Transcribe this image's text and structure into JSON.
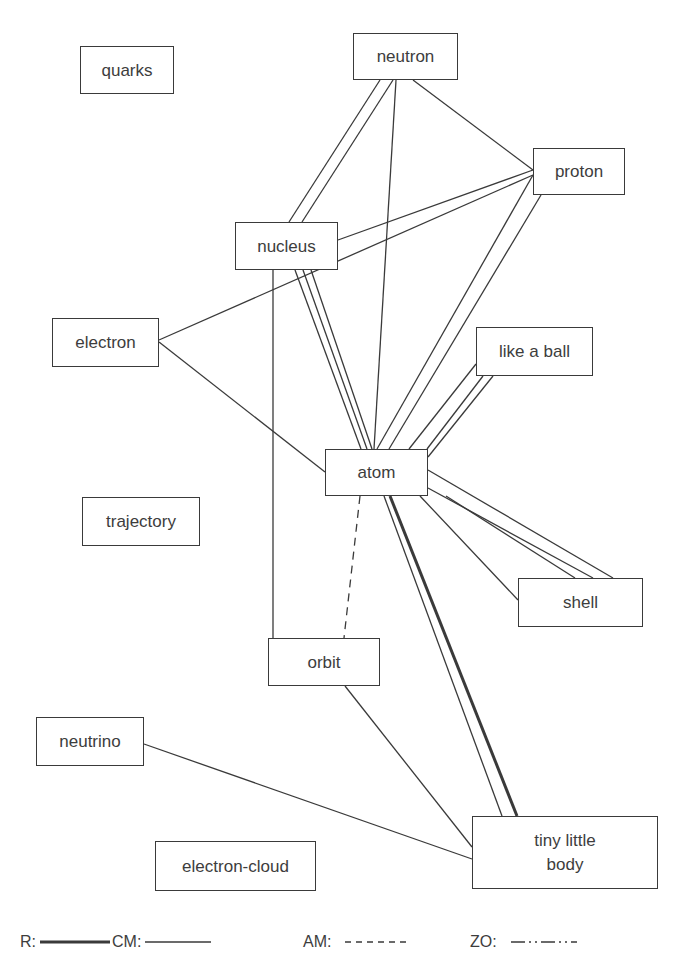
{
  "nodes": [
    {
      "id": "quarks",
      "label": "quarks",
      "x": 80,
      "y": 46,
      "w": 94,
      "h": 48
    },
    {
      "id": "neutron",
      "label": "neutron",
      "x": 353,
      "y": 33,
      "w": 105,
      "h": 47
    },
    {
      "id": "proton",
      "label": "proton",
      "x": 533,
      "y": 148,
      "w": 92,
      "h": 47
    },
    {
      "id": "nucleus",
      "label": "nucleus",
      "x": 235,
      "y": 222,
      "w": 103,
      "h": 48
    },
    {
      "id": "electron",
      "label": "electron",
      "x": 52,
      "y": 318,
      "w": 107,
      "h": 49
    },
    {
      "id": "like-a-ball",
      "label": "like a ball",
      "x": 476,
      "y": 327,
      "w": 117,
      "h": 49
    },
    {
      "id": "atom",
      "label": "atom",
      "x": 325,
      "y": 449,
      "w": 103,
      "h": 47
    },
    {
      "id": "trajectory",
      "label": "trajectory",
      "x": 82,
      "y": 497,
      "w": 118,
      "h": 49
    },
    {
      "id": "shell",
      "label": "shell",
      "x": 518,
      "y": 578,
      "w": 125,
      "h": 49
    },
    {
      "id": "orbit",
      "label": "orbit",
      "x": 268,
      "y": 638,
      "w": 112,
      "h": 48
    },
    {
      "id": "neutrino",
      "label": "neutrino",
      "x": 36,
      "y": 717,
      "w": 108,
      "h": 49
    },
    {
      "id": "electron-cloud",
      "label": "electron-cloud",
      "x": 155,
      "y": 841,
      "w": 161,
      "h": 50
    },
    {
      "id": "tiny-little-body",
      "label": "tiny little body",
      "x": 472,
      "y": 816,
      "w": 186,
      "h": 73
    }
  ],
  "edges": [
    {
      "from": "neutron",
      "to": "nucleus",
      "type": "CM",
      "lines": [
        [
          380,
          80,
          289,
          222
        ],
        [
          393,
          80,
          302,
          222
        ]
      ]
    },
    {
      "from": "neutron",
      "to": "atom",
      "type": "CM",
      "lines": [
        [
          396,
          80,
          374,
          449
        ]
      ]
    },
    {
      "from": "neutron",
      "to": "proton",
      "type": "CM",
      "lines": [
        [
          413,
          80,
          533,
          170
        ]
      ]
    },
    {
      "from": "nucleus",
      "to": "proton",
      "type": "CM",
      "lines": [
        [
          338,
          240,
          533,
          170
        ]
      ]
    },
    {
      "from": "electron",
      "to": "proton",
      "type": "CM",
      "lines": [
        [
          159,
          340,
          533,
          175
        ]
      ]
    },
    {
      "from": "electron",
      "to": "atom",
      "type": "CM",
      "lines": [
        [
          159,
          342,
          325,
          472
        ]
      ]
    },
    {
      "from": "nucleus",
      "to": "atom",
      "type": "CM",
      "lines": [
        [
          295,
          270,
          361,
          449
        ],
        [
          303,
          270,
          367,
          449
        ],
        [
          311,
          270,
          372,
          449
        ]
      ]
    },
    {
      "from": "nucleus",
      "to": "orbit",
      "type": "CM",
      "lines": [
        [
          273,
          270,
          273,
          638
        ]
      ]
    },
    {
      "from": "proton",
      "to": "atom",
      "type": "CM",
      "lines": [
        [
          533,
          175,
          377,
          449
        ],
        [
          541,
          195,
          389,
          449
        ]
      ]
    },
    {
      "from": "like-a-ball",
      "to": "atom",
      "type": "CM",
      "lines": [
        [
          476,
          364,
          409,
          449
        ],
        [
          483,
          376,
          427,
          449
        ],
        [
          493,
          376,
          428,
          457
        ]
      ]
    },
    {
      "from": "atom",
      "to": "shell",
      "type": "CM",
      "lines": [
        [
          428,
          470,
          613,
          578
        ],
        [
          428,
          488,
          593,
          578
        ],
        [
          446,
          496,
          575,
          578
        ],
        [
          420,
          496,
          518,
          600
        ]
      ]
    },
    {
      "from": "atom",
      "to": "orbit",
      "type": "AM",
      "lines": [
        [
          360,
          496,
          344,
          638
        ]
      ]
    },
    {
      "from": "atom",
      "to": "tiny-little-body",
      "type": "CM",
      "lines": [
        [
          384,
          496,
          502,
          816
        ]
      ]
    },
    {
      "from": "atom",
      "to": "tiny-little-body",
      "type": "R",
      "lines": [
        [
          390,
          496,
          517,
          816
        ]
      ]
    },
    {
      "from": "orbit",
      "to": "tiny-little-body",
      "type": "CM",
      "lines": [
        [
          345,
          686,
          472,
          847
        ]
      ]
    },
    {
      "from": "neutrino",
      "to": "tiny-little-body",
      "type": "CM",
      "lines": [
        [
          144,
          744,
          472,
          859
        ]
      ]
    }
  ],
  "legend": [
    {
      "key": "R",
      "label": "R:",
      "style": "R",
      "x": 0,
      "line_w": 70
    },
    {
      "key": "CM",
      "label": "CM:",
      "style": "CM",
      "x": 92,
      "line_w": 66
    },
    {
      "key": "AM",
      "label": "AM:",
      "style": "AM",
      "x": 283,
      "line_w": 66
    },
    {
      "key": "ZO",
      "label": "ZO:",
      "style": "ZO",
      "x": 450,
      "line_w": 66
    }
  ],
  "colors": {
    "line": "#3a3a3a",
    "text": "#3d3d3d",
    "background": "#ffffff"
  }
}
